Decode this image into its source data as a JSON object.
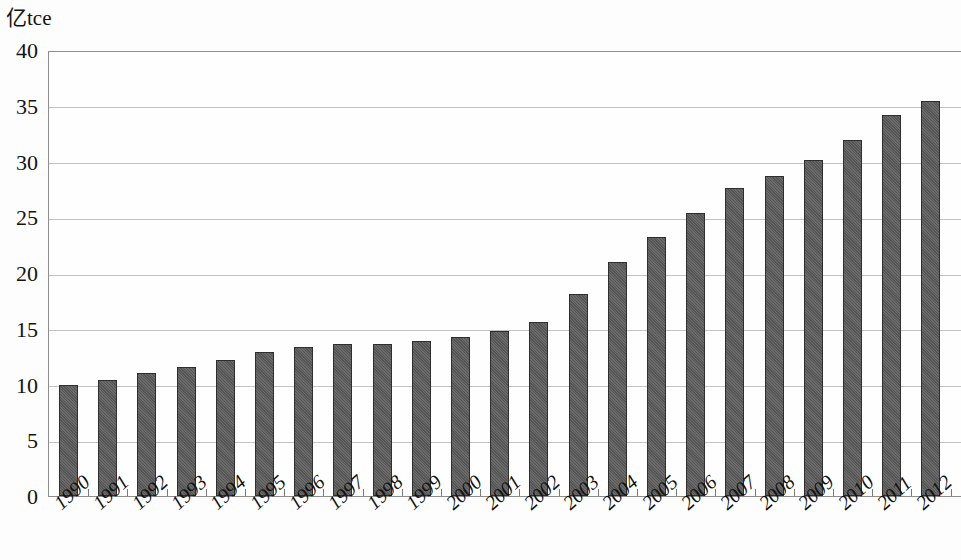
{
  "chart_data": {
    "type": "bar",
    "title": "",
    "subtitle": "",
    "xlabel": "",
    "ylabel": "亿tce",
    "ylim": [
      0,
      40
    ],
    "y_ticks": [
      0,
      5,
      10,
      15,
      20,
      25,
      30,
      35,
      40
    ],
    "grid": true,
    "legend": "none",
    "bar_color": "#5a5a5a",
    "bar_edge_color": "#2e2e2e",
    "gridline_color": "#c2c2c2",
    "axis_color": "#8d8d8d",
    "categories": [
      "1990",
      "1991",
      "1992",
      "1993",
      "1994",
      "1995",
      "1996",
      "1997",
      "1998",
      "1999",
      "2000",
      "2001",
      "2002",
      "2003",
      "2004",
      "2005",
      "2006",
      "2007",
      "2008",
      "2009",
      "2010",
      "2011",
      "2012"
    ],
    "values": [
      10.0,
      10.4,
      11.0,
      11.6,
      12.2,
      12.9,
      13.4,
      13.6,
      13.6,
      13.9,
      14.3,
      14.8,
      15.6,
      18.1,
      21.0,
      23.2,
      25.4,
      27.6,
      28.7,
      30.1,
      31.9,
      34.2,
      35.4
    ],
    "series": [
      {
        "name": "能源消费总量",
        "values": [
          10.0,
          10.4,
          11.0,
          11.6,
          12.2,
          12.9,
          13.4,
          13.6,
          13.6,
          13.9,
          14.3,
          14.8,
          15.6,
          18.1,
          21.0,
          23.2,
          25.4,
          27.6,
          28.7,
          30.1,
          31.9,
          34.2,
          35.4
        ]
      }
    ]
  }
}
